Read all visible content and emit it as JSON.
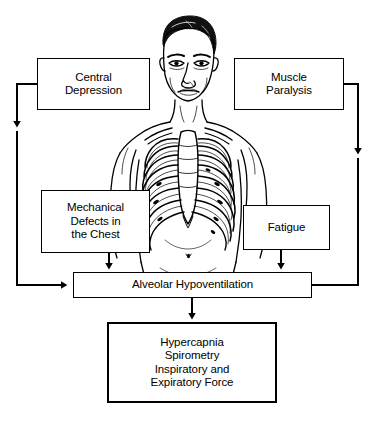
{
  "diagram": {
    "line_color": "#000000",
    "box_fill": "#ffffff",
    "nodes": {
      "central_depression": "Central\nDepression",
      "muscle_paralysis": "Muscle\nParalysis",
      "mechanical_defects": "Mechanical\nDefects in\nthe Chest",
      "fatigue": "Fatigue",
      "alveolar_hypoventilation": "Alveolar Hypoventilation",
      "outcome": "Hypercapnia\nSpirometry\nInspiratory and\nExpiratory Force"
    },
    "illustration": {
      "name": "male-torso-ribcage-anatomy",
      "description": "Line drawing of a male head, neck, shoulders and torso with the rib cage, sternum and clavicles shown anatomically"
    },
    "edges": [
      {
        "from": "central_depression",
        "to": "alveolar_hypoventilation",
        "route": "left-outer"
      },
      {
        "from": "muscle_paralysis",
        "to": "alveolar_hypoventilation",
        "route": "right-outer"
      },
      {
        "from": "mechanical_defects",
        "to": "alveolar_hypoventilation",
        "route": "down"
      },
      {
        "from": "fatigue",
        "to": "alveolar_hypoventilation",
        "route": "down"
      },
      {
        "from": "alveolar_hypoventilation",
        "to": "outcome",
        "route": "down"
      }
    ]
  }
}
